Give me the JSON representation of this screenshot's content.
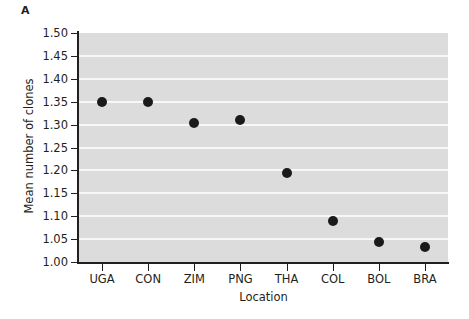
{
  "figure": {
    "panel_label": "A",
    "background_color": "#dcdcdc",
    "gridline_color": "#f7f7f7",
    "axis_color": "#231f20",
    "marker_color": "#1a1a1a"
  },
  "chart_data": {
    "type": "scatter",
    "title": "",
    "xlabel": "Location",
    "ylabel": "Mean number of clones",
    "categories": [
      "UGA",
      "CON",
      "ZIM",
      "PNG",
      "THA",
      "COL",
      "BOL",
      "BRA"
    ],
    "values": [
      1.35,
      1.35,
      1.303,
      1.311,
      1.195,
      1.09,
      1.043,
      1.032
    ],
    "ylim": [
      1.0,
      1.5
    ],
    "ytick_labels": [
      "1.00",
      "1.05",
      "1.10",
      "1.15",
      "1.20",
      "1.25",
      "1.30",
      "1.35",
      "1.40",
      "1.45",
      "1.50"
    ],
    "ytick_values": [
      1.0,
      1.05,
      1.1,
      1.15,
      1.2,
      1.25,
      1.3,
      1.35,
      1.4,
      1.45,
      1.5
    ],
    "grid": true,
    "legend": null,
    "series": [
      {
        "name": "Mean number of clones",
        "values": [
          1.35,
          1.35,
          1.303,
          1.311,
          1.195,
          1.09,
          1.043,
          1.032
        ]
      }
    ]
  }
}
